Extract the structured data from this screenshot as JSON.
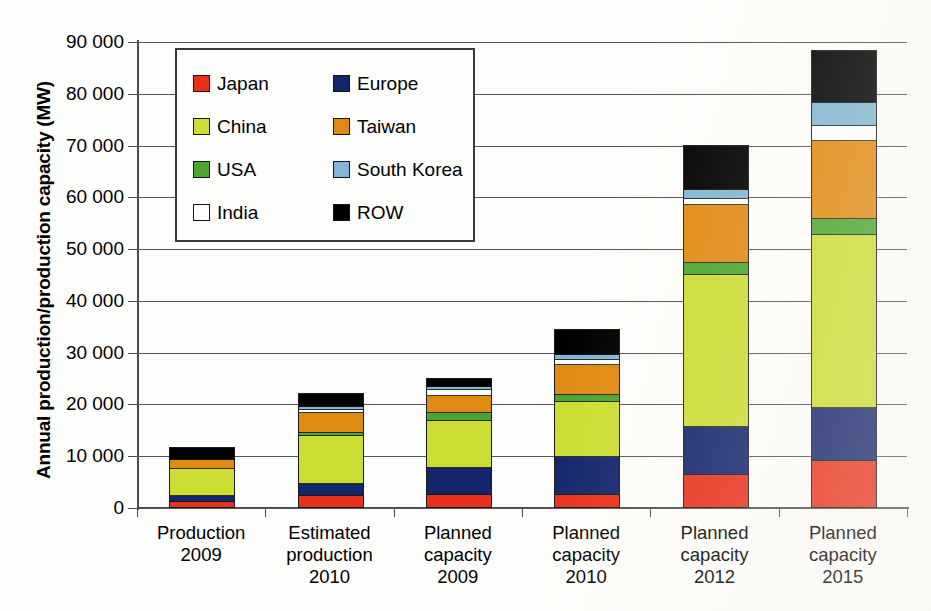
{
  "chart_data": {
    "type": "bar",
    "subtype": "stacked",
    "title": "",
    "xlabel": "",
    "ylabel": "Annual production/production capacity (MW)",
    "ylim": [
      0,
      90000
    ],
    "ytick_step": 10000,
    "ytick_labels": [
      "90 000",
      "80 000",
      "70 000",
      "60 000",
      "50 000",
      "40 000",
      "30 000",
      "20 000",
      "10 000",
      "0"
    ],
    "ytick_values": [
      90000,
      80000,
      70000,
      60000,
      50000,
      40000,
      30000,
      20000,
      10000,
      0
    ],
    "grid": true,
    "legend_position": "upper-left-inside",
    "categories": [
      "Production\n2009",
      "Estimated\nproduction\n2010",
      "Planned\ncapacity\n2009",
      "Planned\ncapacity\n2010",
      "Planned\ncapacity\n2012",
      "Planned\ncapacity\n2015"
    ],
    "category_lines": [
      [
        "Production",
        "2009"
      ],
      [
        "Estimated",
        "production",
        "2010"
      ],
      [
        "Planned",
        "capacity",
        "2009"
      ],
      [
        "Planned",
        "capacity",
        "2010"
      ],
      [
        "Planned",
        "capacity",
        "2012"
      ],
      [
        "Planned",
        "capacity",
        "2015"
      ]
    ],
    "series": [
      {
        "name": "Japan",
        "color": "#e8301a",
        "values": [
          1000,
          2200,
          2300,
          2400,
          6200,
          8800
        ]
      },
      {
        "name": "Europe",
        "color": "#13256b",
        "values": [
          1100,
          2300,
          5300,
          7200,
          9200,
          10300
        ]
      },
      {
        "name": "China",
        "color": "#ccdd33",
        "values": [
          5200,
          9300,
          9000,
          10700,
          29400,
          33500
        ]
      },
      {
        "name": "USA",
        "color": "#4ba52e",
        "values": [
          0,
          500,
          1600,
          1300,
          2300,
          3000
        ]
      },
      {
        "name": "Taiwan",
        "color": "#e08a12",
        "values": [
          1800,
          3900,
          3200,
          5800,
          11200,
          15000
        ]
      },
      {
        "name": "India",
        "color": "#ffffff",
        "values": [
          0,
          600,
          1200,
          1000,
          1100,
          2900
        ]
      },
      {
        "name": "South Korea",
        "color": "#81b7d4",
        "values": [
          0,
          600,
          600,
          1000,
          1800,
          4600
        ]
      },
      {
        "name": "ROW",
        "color": "#000000",
        "values": [
          2300,
          2400,
          1600,
          4800,
          8600,
          9900
        ]
      }
    ],
    "stack_order_bottom_to_top": [
      "Japan",
      "Europe",
      "China",
      "USA",
      "Taiwan",
      "India",
      "South Korea",
      "ROW"
    ],
    "totals": [
      11400,
      21800,
      24800,
      34200,
      69800,
      88000
    ]
  },
  "legend": {
    "items": [
      {
        "label": "Japan",
        "color": "#e8301a",
        "name": "legend-item-japan"
      },
      {
        "label": "Europe",
        "color": "#13256b",
        "name": "legend-item-europe"
      },
      {
        "label": "China",
        "color": "#ccdd33",
        "name": "legend-item-china"
      },
      {
        "label": "Taiwan",
        "color": "#e08a12",
        "name": "legend-item-taiwan"
      },
      {
        "label": "USA",
        "color": "#4ba52e",
        "name": "legend-item-usa"
      },
      {
        "label": "South Korea",
        "color": "#81b7d4",
        "name": "legend-item-south-korea"
      },
      {
        "label": "India",
        "color": "#ffffff",
        "name": "legend-item-india"
      },
      {
        "label": "ROW",
        "color": "#000000",
        "name": "legend-item-row"
      }
    ]
  },
  "axis": {
    "y_title": "Annual production/production capacity (MW)"
  }
}
